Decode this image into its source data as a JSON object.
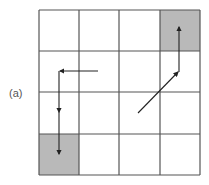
{
  "figure": {
    "label": "(a)",
    "grid": {
      "rows": 4,
      "cols": 4,
      "origin_x": 39,
      "origin_y": 10,
      "cell_size": 40.25,
      "line_color": "#555555",
      "fill_color": "#ffffff"
    },
    "shaded_cells": [
      {
        "row": 0,
        "col": 3,
        "color": "#b9b9b9",
        "role": "goal-top-right"
      },
      {
        "row": 3,
        "col": 0,
        "color": "#b9b9b9",
        "role": "goal-bottom-left"
      }
    ],
    "arrow_color": "#222222",
    "paths": [
      {
        "name": "left-path",
        "segments": [
          {
            "from": [
              98,
              71
            ],
            "to": [
              60,
              71
            ],
            "arrowhead": "left"
          },
          {
            "from": [
              59,
              71
            ],
            "to": [
              59,
              112
            ],
            "arrowhead": "down"
          },
          {
            "from": [
              59,
              112
            ],
            "to": [
              59,
              154
            ],
            "arrowhead": "down"
          }
        ]
      },
      {
        "name": "right-path",
        "segments": [
          {
            "from": [
              138,
              113
            ],
            "to": [
              178,
              72
            ],
            "arrowhead": "up-right"
          },
          {
            "from": [
              179,
              72
            ],
            "to": [
              179,
              27
            ],
            "arrowhead": "up"
          }
        ]
      }
    ]
  }
}
